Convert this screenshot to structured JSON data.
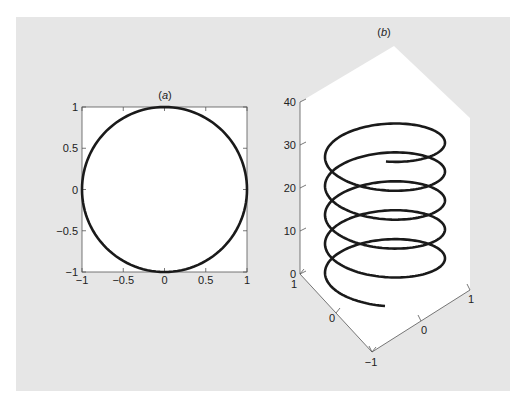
{
  "colors": {
    "panel_background": "#e6e6e6",
    "plot_background": "#ffffff",
    "curve": "#1a1a1a",
    "axis": "#555555"
  },
  "chart_data": [
    {
      "id": "a",
      "type": "line",
      "title": "(a)",
      "title_letter": "a",
      "description": "Unit circle: x = cos(t), y = sin(t)",
      "xlabel": "",
      "ylabel": "",
      "xlim": [
        -1,
        1
      ],
      "ylim": [
        -1,
        1
      ],
      "grid": false,
      "xticks": [
        -1,
        -0.5,
        0,
        0.5,
        1
      ],
      "yticks": [
        -1,
        -0.5,
        0,
        0.5,
        1
      ],
      "xtick_labels": [
        "−1",
        "−0.5",
        "0",
        "0.5",
        "1"
      ],
      "ytick_labels": [
        "−1",
        "−0.5",
        "0",
        "0.5",
        "1"
      ],
      "series": [
        {
          "name": "circle",
          "x": [
            1,
            0.707,
            0,
            -0.707,
            -1,
            -0.707,
            0,
            0.707,
            1
          ],
          "y": [
            0,
            0.707,
            1,
            0.707,
            0,
            -0.707,
            -1,
            -0.707,
            0
          ]
        }
      ]
    },
    {
      "id": "b",
      "type": "line3d",
      "title": "(b)",
      "title_letter": "b",
      "description": "Helix: x = sin(t), y = cos(t), z = t, t from 0 to ~10π",
      "xlim": [
        -1,
        1
      ],
      "ylim": [
        -1,
        1
      ],
      "zlim": [
        0,
        40
      ],
      "grid": false,
      "zticks": [
        0,
        10,
        20,
        30,
        40
      ],
      "ztick_labels": [
        "0",
        "10",
        "20",
        "30",
        "40"
      ],
      "x_axis_tick_labels": [
        "−1",
        "0",
        "1"
      ],
      "y_axis_tick_labels": [
        "−1",
        "0",
        "1"
      ],
      "series": [
        {
          "name": "helix",
          "t_start": 0,
          "t_end": 31.4,
          "turns": 5,
          "z_start": 0,
          "z_end": 31.4
        }
      ]
    }
  ]
}
